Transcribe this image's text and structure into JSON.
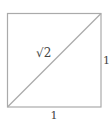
{
  "diagram": {
    "type": "unit-square-diagonal",
    "shape": "square",
    "stroke_color": "#aaaaaa",
    "text_color": "#444444",
    "labels": {
      "diagonal": "√2",
      "right_side": "1",
      "bottom_side": "1"
    }
  }
}
